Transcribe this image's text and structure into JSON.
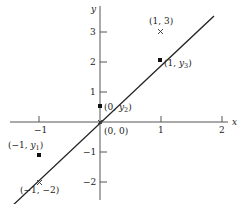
{
  "diagram": {
    "axes": {
      "x_label": "x",
      "y_label": "y",
      "x_ticks": [
        {
          "value": -1,
          "label": "−1"
        },
        {
          "value": 1,
          "label": "1"
        },
        {
          "value": 2,
          "label": "2"
        }
      ],
      "y_ticks": [
        {
          "value": 3,
          "label": "3"
        },
        {
          "value": 2,
          "label": "2"
        },
        {
          "value": 1,
          "label": "1"
        },
        {
          "value": -1,
          "label": "−1"
        },
        {
          "value": -2,
          "label": "−2"
        }
      ]
    },
    "data_points": [
      {
        "label": "(1, 3)",
        "marker": "cross"
      },
      {
        "label": "(−1, −2)",
        "marker": "cross"
      },
      {
        "label": "(0, 0)",
        "marker": "cross"
      }
    ],
    "line_points": [
      {
        "label_prefix": "(1, ",
        "var": "y",
        "sub": "3",
        "label_suffix": ")"
      },
      {
        "label_prefix": "(0, ",
        "var": "y",
        "sub": "2",
        "label_suffix": ")"
      },
      {
        "label_prefix": "(−1, ",
        "var": "y",
        "sub": "1",
        "label_suffix": ")"
      }
    ],
    "colors": {
      "stroke": "#222222",
      "axis": "#555555"
    }
  }
}
